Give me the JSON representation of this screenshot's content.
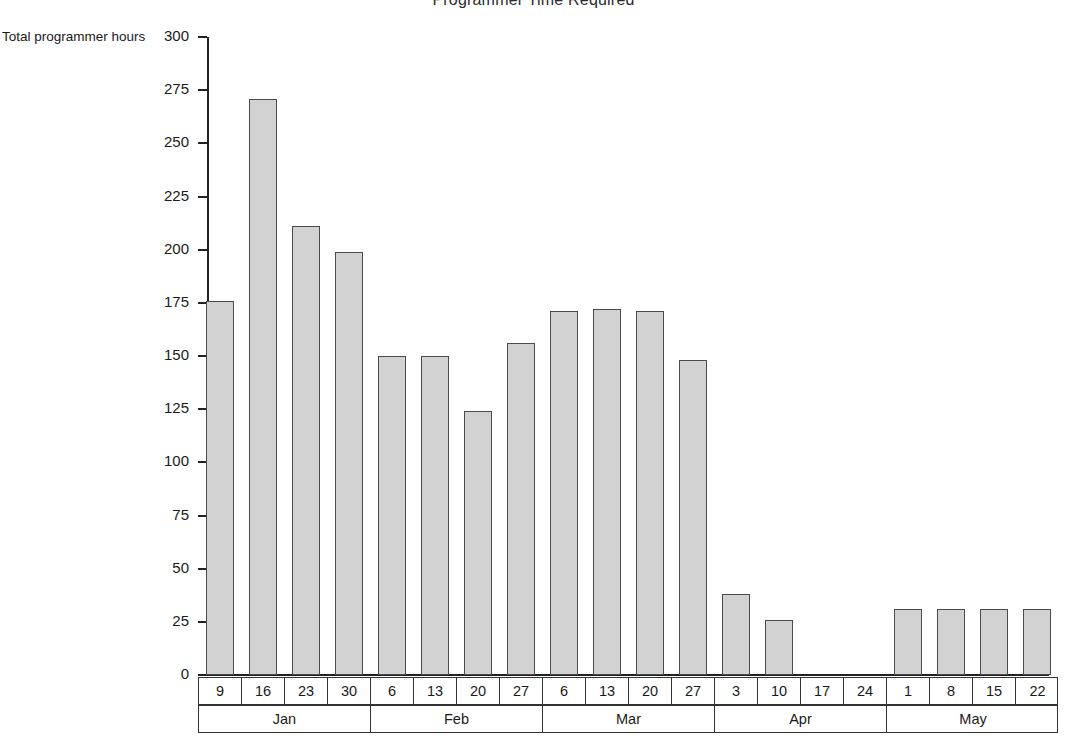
{
  "chart_data": {
    "type": "bar",
    "title": "Programmer Time Required",
    "ylabel": "Total programmer hours",
    "xlabel": "",
    "ylim": [
      0,
      300
    ],
    "ytick_step": 25,
    "grid": false,
    "legend": null,
    "yticks": [
      "300",
      "275",
      "250",
      "225",
      "200",
      "175",
      "150",
      "125",
      "100",
      "75",
      "50",
      "25",
      "0"
    ],
    "ytick_values": [
      300,
      275,
      250,
      225,
      200,
      175,
      150,
      125,
      100,
      75,
      50,
      25,
      0
    ],
    "categories": [
      "Jan 9",
      "Jan 16",
      "Jan 23",
      "Jan 30",
      "Feb 6",
      "Feb 13",
      "Feb 20",
      "Feb 27",
      "Mar 6",
      "Mar 13",
      "Mar 20",
      "Mar 27",
      "Apr 3",
      "Apr 10",
      "Apr 17",
      "Apr 24",
      "May 1",
      "May 8",
      "May 15",
      "May 22"
    ],
    "values": [
      176,
      271,
      211,
      199,
      150,
      150,
      124,
      156,
      171,
      172,
      171,
      148,
      38,
      26,
      0,
      0,
      31,
      31,
      31,
      31
    ],
    "day_labels": [
      "9",
      "16",
      "23",
      "30",
      "6",
      "13",
      "20",
      "27",
      "6",
      "13",
      "20",
      "27",
      "3",
      "10",
      "17",
      "24",
      "1",
      "8",
      "15",
      "22"
    ],
    "month_labels": [
      "Jan",
      "Feb",
      "Mar",
      "Apr",
      "May"
    ],
    "weeks_per_month": 4,
    "bar_fill_color": "#d2d2d2",
    "bar_border_color": "#4a4a4a",
    "axis_color": "#222222"
  }
}
